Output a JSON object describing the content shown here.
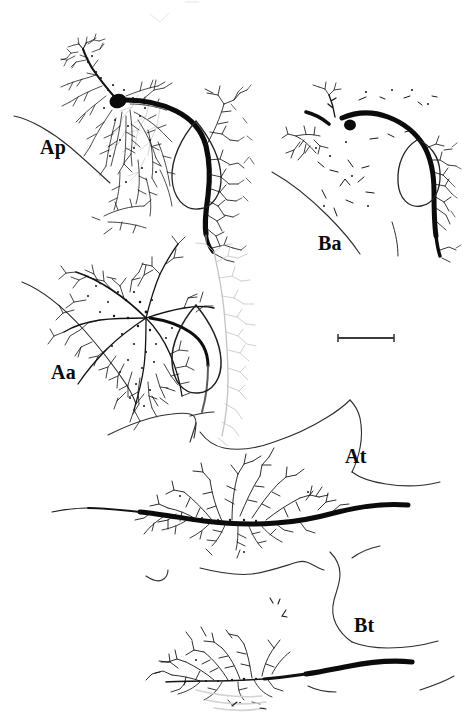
{
  "figure": {
    "kind": "camera-lucida-neuron-reconstruction-figure",
    "background_color": "#ffffff",
    "ink_color": "#0d0d0d",
    "faint_ink_color": "#b9b9b9",
    "outline_color": "#2a2a2a",
    "width_px": 471,
    "height_px": 723
  },
  "panels": [
    {
      "id": "ap",
      "label": "Ap",
      "description": "Proximal dendritic arbor of cell A with filled soma, thick descending axon and teardrop-shaped nucleus outline",
      "label_x": 40,
      "label_y": 137
    },
    {
      "id": "ba",
      "label": "Ba",
      "description": "Sparse proximal arbor of cell B with small filled soma and thick axon skirting the teardrop outline",
      "label_x": 318,
      "label_y": 233
    },
    {
      "id": "aa",
      "label": "Aa",
      "description": "Dense dendritic arbor of cell A with faint grey background arborization and teardrop outline",
      "label_x": 51,
      "label_y": 362
    },
    {
      "id": "at",
      "label": "At",
      "description": "Terminal axonal arborization of cell A along a horizontal thick axon",
      "label_x": 345,
      "label_y": 446
    },
    {
      "id": "bt",
      "label": "Bt",
      "description": "Terminal axonal arborization of cell B along a horizontal thick axon",
      "label_x": 354,
      "label_y": 615
    }
  ],
  "scale_bar": {
    "present": true,
    "label": "",
    "x1": 338,
    "x2": 394,
    "y": 338
  },
  "structures": {
    "soma_ap": {
      "cx": 118,
      "cy": 101,
      "rx": 8.5,
      "ry": 7
    },
    "soma_ba": {
      "cx": 350,
      "cy": 124,
      "rx": 5.5,
      "ry": 5
    },
    "teardrop_ap": {
      "cx": 196,
      "cy": 168
    },
    "teardrop_ba": {
      "cx": 417,
      "cy": 165
    },
    "teardrop_aa": {
      "cx": 196,
      "cy": 345
    }
  }
}
